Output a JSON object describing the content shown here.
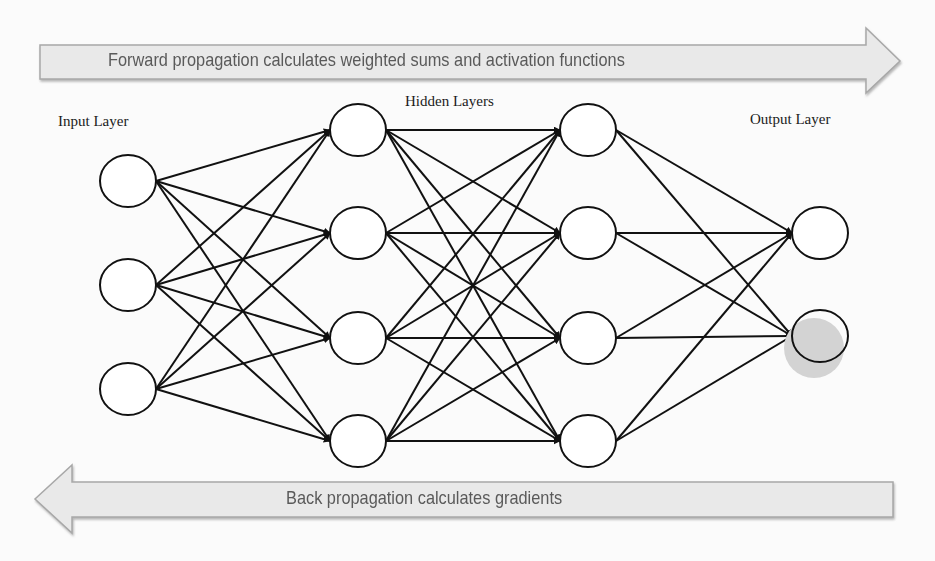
{
  "diagram": {
    "type": "feed-forward neural network",
    "forward_arrow": {
      "label": "Forward propagation calculates weighted sums and activation functions",
      "direction": "right"
    },
    "backward_arrow": {
      "label": "Back propagation calculates gradients",
      "direction": "left"
    },
    "layers": [
      {
        "id": "input",
        "label": "Input Layer",
        "node_count": 3
      },
      {
        "id": "hidden1",
        "label": "Hidden Layers",
        "node_count": 4
      },
      {
        "id": "hidden2",
        "label": "",
        "node_count": 4
      },
      {
        "id": "output",
        "label": "Output Layer",
        "node_count": 2
      }
    ],
    "connectivity": "fully connected between adjacent layers",
    "highlighted_node": {
      "layer": "output",
      "index": 2,
      "color": "#d3d3d3"
    },
    "colors": {
      "arrow_fill": "#e9e9e9",
      "arrow_stroke": "#a8a8a8",
      "arrow_text": "#5a5a5a",
      "edge": "#111111",
      "node_stroke": "#111111",
      "node_fill": "#ffffff",
      "highlight": "#d3d3d3"
    }
  }
}
